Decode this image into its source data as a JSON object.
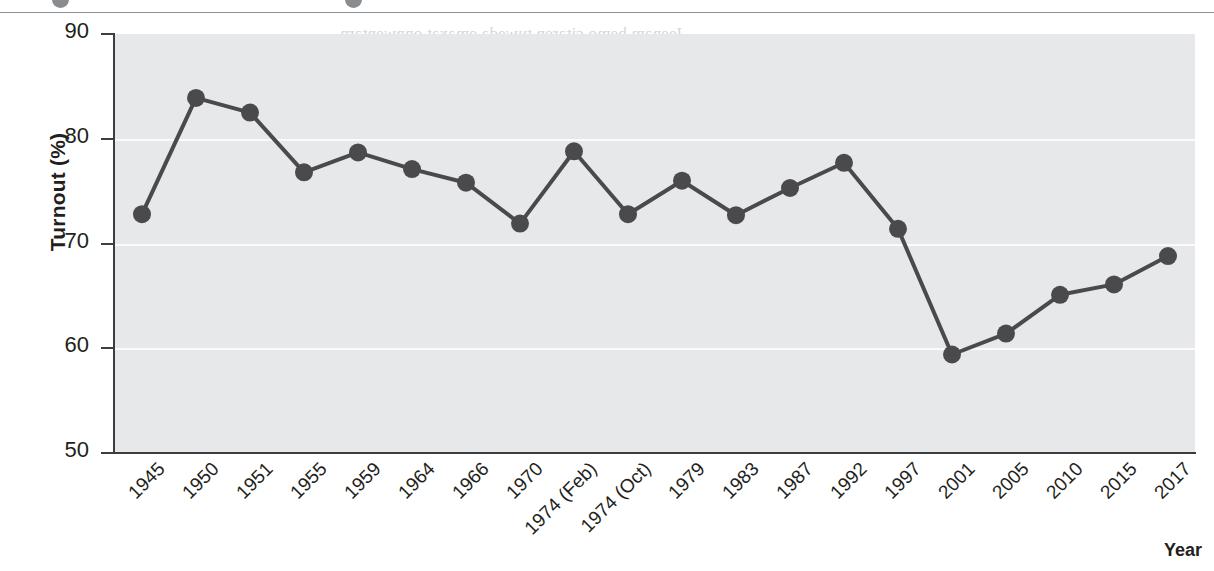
{
  "figure": {
    "y_axis_title": "Turnout (%)",
    "x_axis_title": "Year"
  },
  "bleed_text": {
    "heading": "Eligibility",
    "lines": [
      "Jeenam bemo citaren tuweda emaxat onnwentarn",
      "ne the asen amo lemoner peranl do ertase sal te",
      "ce tronem cad the vene ner maribben",
      "pre tronecly ree some nomim entat quaning te ter",
      "bo roc cadae seerer",
      "tan ttall tlecvea aes sorenber oempaaes br en  anme",
      "as the prey Avail eas at setaoc. Ferodre teont recke",
      "aall Wemnlan ef Sen anv mahdan nall the ov mincef la",
      "lheater aniha ner Co On Gadlh bertc a vaplhe ereal"
    ]
  },
  "chart_data": {
    "type": "line",
    "title": "",
    "xlabel": "Year",
    "ylabel": "Turnout (%)",
    "ylim": [
      50,
      90
    ],
    "yticks": [
      50,
      60,
      70,
      80,
      90
    ],
    "grid": true,
    "legend": false,
    "series_color": "#4a4a4c",
    "categories": [
      "1945",
      "1950",
      "1951",
      "1955",
      "1959",
      "1964",
      "1966",
      "1970",
      "1974 (Feb)",
      "1974 (Oct)",
      "1979",
      "1983",
      "1987",
      "1992",
      "1997",
      "2001",
      "2005",
      "2010",
      "2015",
      "2017"
    ],
    "series": [
      {
        "name": "Turnout",
        "values": [
          72.8,
          83.9,
          82.5,
          76.8,
          78.7,
          77.1,
          75.8,
          71.9,
          78.8,
          72.8,
          76.0,
          72.7,
          75.3,
          77.7,
          71.4,
          59.4,
          61.4,
          65.1,
          66.1,
          68.8
        ]
      }
    ]
  }
}
